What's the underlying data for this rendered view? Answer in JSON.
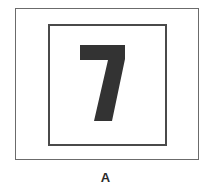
{
  "figure": {
    "numeral": "7",
    "caption": "A",
    "colors": {
      "outer_border": "#6b6b6b",
      "inner_border": "#4a4a4a",
      "numeral_fill": "#333333",
      "caption": "#2b2b2b",
      "background": "#ffffff"
    }
  }
}
